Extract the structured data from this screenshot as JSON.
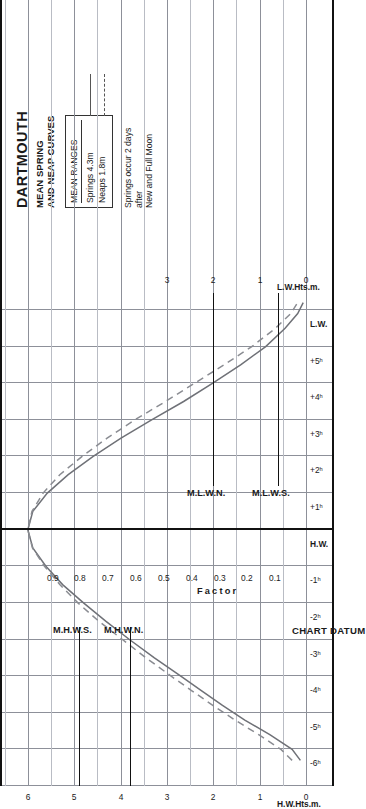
{
  "header": {
    "title": "DARTMOUTH",
    "subtitle_line1": "MEAN SPRING",
    "subtitle_line2": "AND NEAP CURVES"
  },
  "legend": {
    "heading": "MEAN RANGES",
    "rows": [
      {
        "label": "Springs  4.3m",
        "style": "solid"
      },
      {
        "label": "Neaps  1.8m",
        "style": "dashed"
      }
    ]
  },
  "note": {
    "line1": "Springs occur 2 days",
    "line2": "after",
    "line3": "New and Full Moon"
  },
  "labels": {
    "hw_axis_title": "H.W.Hts.m.",
    "lw_axis_title": "L.W.Hts.m.",
    "chart_datum": "CHART DATUM",
    "factor_word": "Factor",
    "hw_marker": "H.W.",
    "lw_marker_left": "L.W.",
    "lw_marker_right": "L.W.",
    "mhws": "M.H.W.S.",
    "mhwn": "M.H.W.N.",
    "mlwn": "M.L.W.N.",
    "mlws": "M.L.W.S."
  },
  "chart_data": {
    "type": "line",
    "xlabel": "Hours relative to High Water",
    "ylabel": "Height (m)",
    "grid": true,
    "legend_position": "top-right",
    "time_axis": {
      "ticks": [
        "-6ʰ",
        "-5ʰ",
        "-4ʰ",
        "-3ʰ",
        "-2ʰ",
        "-1ʰ",
        "H.W.",
        "+1ʰ",
        "+2ʰ",
        "+3ʰ",
        "+4ʰ",
        "+5ʰ",
        "L.W."
      ],
      "values": [
        -6,
        -5,
        -4,
        -3,
        -2,
        -1,
        0,
        1,
        2,
        3,
        4,
        5,
        6
      ],
      "xlim": [
        -7,
        6.6
      ]
    },
    "hw_height_axis": {
      "label": "H.W.Hts.m.",
      "ticks": [
        0,
        1,
        2,
        3,
        4,
        5,
        6
      ],
      "ylim": [
        0,
        6.6
      ]
    },
    "lw_height_axis": {
      "label": "L.W.Hts.m.",
      "ticks": [
        0,
        1,
        2,
        3
      ],
      "ylim": [
        0,
        3.3
      ]
    },
    "factor_axis": {
      "label": "Factor",
      "ticks": [
        0.9,
        0.8,
        0.7,
        0.6,
        0.5,
        0.4,
        0.3,
        0.2,
        0.1
      ],
      "tick_labels": [
        "0.9",
        "0.8",
        "0.7",
        "0.6",
        "0.5",
        "0.4",
        "0.3",
        "0.2",
        "0.1"
      ]
    },
    "datum_lines": [
      {
        "name": "M.H.W.S.",
        "side": "hw",
        "value": 4.9
      },
      {
        "name": "M.H.W.N.",
        "side": "hw",
        "value": 3.8
      },
      {
        "name": "M.L.W.N.",
        "side": "lw",
        "value": 2.0
      },
      {
        "name": "M.L.W.S.",
        "side": "lw",
        "value": 0.6
      }
    ],
    "mean_ranges": {
      "springs_m": 4.3,
      "neaps_m": 1.8
    },
    "series": [
      {
        "name": "Springs  4.3m",
        "style": "solid",
        "points": [
          {
            "t": -6.3,
            "f": 0.02
          },
          {
            "t": -6.0,
            "f": 0.05
          },
          {
            "t": -5.6,
            "f": 0.13
          },
          {
            "t": -5.2,
            "f": 0.22
          },
          {
            "t": -4.8,
            "f": 0.3
          },
          {
            "t": -4.4,
            "f": 0.375
          },
          {
            "t": -4.0,
            "f": 0.45
          },
          {
            "t": -3.5,
            "f": 0.545
          },
          {
            "t": -3.0,
            "f": 0.635
          },
          {
            "t": -2.5,
            "f": 0.72
          },
          {
            "t": -2.0,
            "f": 0.8
          },
          {
            "t": -1.5,
            "f": 0.875
          },
          {
            "t": -1.0,
            "f": 0.935
          },
          {
            "t": -0.5,
            "f": 0.982
          },
          {
            "t": 0.0,
            "f": 1.0
          },
          {
            "t": 0.5,
            "f": 0.982
          },
          {
            "t": 1.0,
            "f": 0.93
          },
          {
            "t": 1.5,
            "f": 0.855
          },
          {
            "t": 2.0,
            "f": 0.765
          },
          {
            "t": 2.5,
            "f": 0.665
          },
          {
            "t": 3.0,
            "f": 0.555
          },
          {
            "t": 3.5,
            "f": 0.44
          },
          {
            "t": 4.0,
            "f": 0.335
          },
          {
            "t": 4.5,
            "f": 0.235
          },
          {
            "t": 5.0,
            "f": 0.145
          },
          {
            "t": 5.5,
            "f": 0.075
          },
          {
            "t": 5.9,
            "f": 0.03
          },
          {
            "t": 6.2,
            "f": 0.01
          }
        ]
      },
      {
        "name": "Neaps  1.8m",
        "style": "dashed",
        "points": [
          {
            "t": -6.3,
            "f": 0.05
          },
          {
            "t": -6.0,
            "f": 0.09
          },
          {
            "t": -5.6,
            "f": 0.17
          },
          {
            "t": -5.2,
            "f": 0.255
          },
          {
            "t": -4.8,
            "f": 0.335
          },
          {
            "t": -4.4,
            "f": 0.41
          },
          {
            "t": -4.0,
            "f": 0.485
          },
          {
            "t": -3.5,
            "f": 0.575
          },
          {
            "t": -3.0,
            "f": 0.66
          },
          {
            "t": -2.5,
            "f": 0.745
          },
          {
            "t": -2.0,
            "f": 0.82
          },
          {
            "t": -1.5,
            "f": 0.885
          },
          {
            "t": -1.0,
            "f": 0.94
          },
          {
            "t": -0.5,
            "f": 0.983
          },
          {
            "t": 0.0,
            "f": 1.0
          },
          {
            "t": 0.5,
            "f": 0.985
          },
          {
            "t": 1.0,
            "f": 0.945
          },
          {
            "t": 1.5,
            "f": 0.885
          },
          {
            "t": 2.0,
            "f": 0.805
          },
          {
            "t": 2.5,
            "f": 0.715
          },
          {
            "t": 3.0,
            "f": 0.615
          },
          {
            "t": 3.5,
            "f": 0.505
          },
          {
            "t": 4.0,
            "f": 0.4
          },
          {
            "t": 4.5,
            "f": 0.295
          },
          {
            "t": 5.0,
            "f": 0.195
          },
          {
            "t": 5.5,
            "f": 0.11
          },
          {
            "t": 5.9,
            "f": 0.055
          },
          {
            "t": 6.2,
            "f": 0.03
          }
        ]
      }
    ]
  }
}
